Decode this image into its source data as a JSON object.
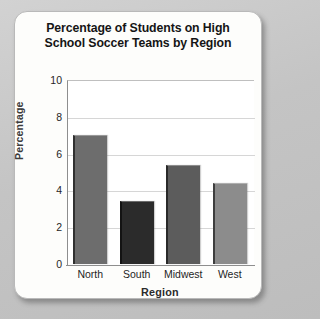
{
  "card": {
    "background_color": "#fdfdfb",
    "page_background_color": "#c9c9c9"
  },
  "chart_data": {
    "type": "bar",
    "title": "Percentage of Students on High School Soccer Teams by Region",
    "title_line1": "Percentage of Students on High",
    "title_line2": "School Soccer Teams by Region",
    "categories": [
      "North",
      "South",
      "Midwest",
      "West"
    ],
    "values": [
      7.0,
      3.4,
      5.4,
      4.4
    ],
    "bar_colors": [
      "#6d6d6d",
      "#2b2b2b",
      "#5c5c5c",
      "#8c8c8c"
    ],
    "xlabel": "Region",
    "ylabel": "Percentage",
    "ylim": [
      0,
      10
    ],
    "yticks": [
      10,
      8,
      6,
      4,
      2,
      0
    ],
    "ytick_labels": [
      "10",
      "8",
      "6",
      "4",
      "2",
      "0"
    ],
    "grid": true,
    "legend": "none"
  }
}
